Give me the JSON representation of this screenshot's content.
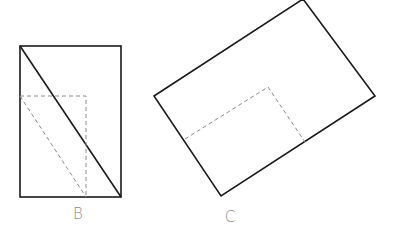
{
  "figures": [
    {
      "label": "B",
      "outer_rect": {
        "x1": 20,
        "y1": 46,
        "x2": 121,
        "y2": 197
      },
      "diagonal": {
        "x1": 20,
        "y1": 46,
        "x2": 121,
        "y2": 197
      },
      "dashed_rect": {
        "x1": 20,
        "y1": 96,
        "x2": 86,
        "y2": 197
      },
      "dashed_diagonal": {
        "x1": 20,
        "y1": 96,
        "x2": 86,
        "y2": 197
      },
      "label_pos": {
        "x": 78,
        "y": 219
      }
    },
    {
      "label": "C",
      "outer_polygon": [
        [
          154,
          96
        ],
        [
          303,
          -1
        ],
        [
          375,
          96
        ],
        [
          221,
          196
        ]
      ],
      "dashed_polyline": [
        [
          185,
          139
        ],
        [
          268,
          87
        ],
        [
          305,
          142
        ]
      ],
      "label_pos": {
        "x": 230,
        "y": 222
      }
    }
  ],
  "colors": {
    "solid": "#1a1a1a",
    "dashed": "#8a8a8a",
    "label": "#8a8a8a"
  }
}
